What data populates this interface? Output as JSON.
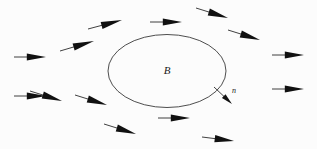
{
  "figure": {
    "background_color": "#fcfcfc",
    "width": 317,
    "height": 149,
    "region_label": "B",
    "normal_label": "n",
    "stroke_color": "#2b2b2b",
    "outline_color": "#3a3a3a",
    "arrow_fill": "#111111"
  },
  "chart_data": {
    "type": "scatter",
    "title": "",
    "xlabel": "",
    "ylabel": "",
    "grid": false,
    "legend": null,
    "xlim": [
      0,
      317
    ],
    "ylim": [
      0,
      149
    ],
    "region": {
      "name": "B",
      "shape": "ellipse",
      "cx": 167,
      "cy": 71,
      "rx": 59,
      "ry": 36.5,
      "label_x": 167,
      "label_y": 74
    },
    "normal_vector": {
      "name": "n",
      "x1": 214,
      "y1": 87,
      "x2": 232,
      "y2": 104,
      "label_x": 234,
      "label_y": 93
    },
    "arrows": [
      {
        "id": "left-upper",
        "x1": 14,
        "y1": 57,
        "x2": 46,
        "y2": 57
      },
      {
        "id": "left-lower",
        "x1": 14,
        "y1": 96,
        "x2": 46,
        "y2": 96
      },
      {
        "id": "upper-left-outer",
        "x1": 60,
        "y1": 51,
        "x2": 94,
        "y2": 41
      },
      {
        "id": "upper-left-inner",
        "x1": 88,
        "y1": 29,
        "x2": 122,
        "y2": 20
      },
      {
        "id": "top-center",
        "x1": 150,
        "y1": 22,
        "x2": 182,
        "y2": 22
      },
      {
        "id": "top-right-inner",
        "x1": 196,
        "y1": 8,
        "x2": 228,
        "y2": 18
      },
      {
        "id": "top-right-outer",
        "x1": 228,
        "y1": 30,
        "x2": 260,
        "y2": 40
      },
      {
        "id": "right-upper",
        "x1": 272,
        "y1": 55,
        "x2": 304,
        "y2": 55
      },
      {
        "id": "right-lower",
        "x1": 272,
        "y1": 89,
        "x2": 304,
        "y2": 89
      },
      {
        "id": "bottom-left-outer",
        "x1": 30,
        "y1": 91,
        "x2": 62,
        "y2": 101
      },
      {
        "id": "bottom-left-inner",
        "x1": 75,
        "y1": 95,
        "x2": 107,
        "y2": 105
      },
      {
        "id": "bottom-center-low",
        "x1": 104,
        "y1": 124,
        "x2": 136,
        "y2": 134
      },
      {
        "id": "bottom-center",
        "x1": 158,
        "y1": 118,
        "x2": 190,
        "y2": 118
      },
      {
        "id": "bottom-right",
        "x1": 202,
        "y1": 137,
        "x2": 234,
        "y2": 141
      }
    ]
  }
}
